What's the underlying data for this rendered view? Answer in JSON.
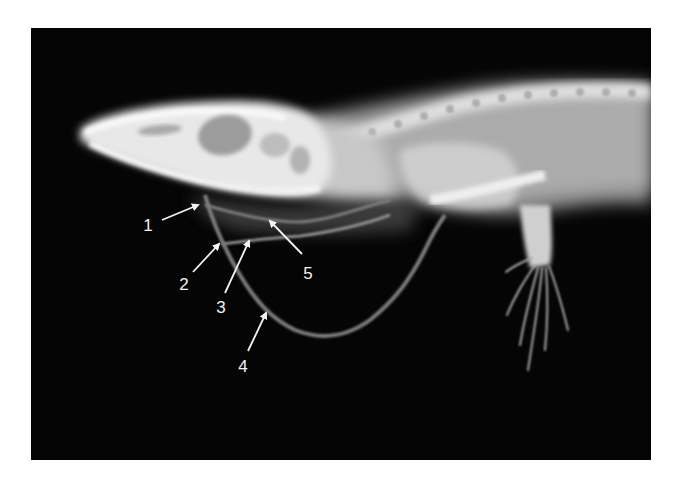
{
  "figure": {
    "background_color": "#050505",
    "page_color": "#ffffff",
    "annotation_color": "#f2f2f2",
    "annotations": [
      {
        "number": "1",
        "label_x": 148,
        "label_y": 225,
        "arrow_from": [
          162,
          220
        ],
        "arrow_to": [
          198,
          205
        ]
      },
      {
        "number": "2",
        "label_x": 184,
        "label_y": 284,
        "arrow_from": [
          193,
          272
        ],
        "arrow_to": [
          219,
          244
        ]
      },
      {
        "number": "3",
        "label_x": 221,
        "label_y": 307,
        "arrow_from": [
          225,
          293
        ],
        "arrow_to": [
          249,
          241
        ]
      },
      {
        "number": "4",
        "label_x": 243,
        "label_y": 366,
        "arrow_from": [
          248,
          351
        ],
        "arrow_to": [
          266,
          313
        ]
      },
      {
        "number": "5",
        "label_x": 308,
        "label_y": 273,
        "arrow_from": [
          302,
          254
        ],
        "arrow_to": [
          270,
          221
        ]
      }
    ]
  }
}
